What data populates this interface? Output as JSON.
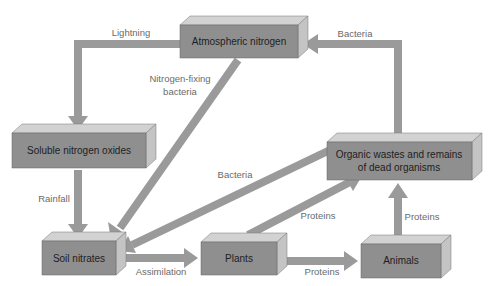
{
  "diagram": {
    "colors": {
      "box_front": "#8f8f8f",
      "box_top": "#d2d2d2",
      "box_side": "#c4c4c4",
      "arrow": "#9a9a9a",
      "label": "#6a6a6a",
      "box_text": "#1e1e1e"
    },
    "nodes": {
      "atmospheric_nitrogen": "Atmospheric nitrogen",
      "soluble_nitrogen_oxides": "Soluble nitrogen oxides",
      "organic_wastes_line1": "Organic wastes and remains",
      "organic_wastes_line2": "of dead organisms",
      "soil_nitrates": "Soil nitrates",
      "plants": "Plants",
      "animals": "Animals"
    },
    "edges": {
      "lightning": "Lightning",
      "nitrogen_fixing_line1": "Nitrogen-fixing",
      "nitrogen_fixing_line2": "bacteria",
      "bacteria_top": "Bacteria",
      "bacteria_middle": "Bacteria",
      "rainfall": "Rainfall",
      "assimilation": "Assimilation",
      "proteins_plants_to_organic": "Proteins",
      "proteins_plants_to_animals": "Proteins",
      "proteins_animals_to_organic": "Proteins"
    }
  }
}
